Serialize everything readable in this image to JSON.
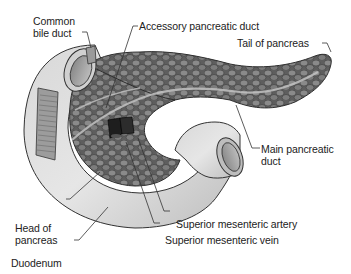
{
  "diagram": {
    "colors": {
      "pancreas_fill": "#6e6e6e",
      "pancreas_lobule": "#858585",
      "lobule_outline": "#3a3a3a",
      "duodenum_fill": "#c9c9c9",
      "duodenum_highlight": "#e4e4e4",
      "vessel": "#1e1e1e",
      "duct": "#b8b8b8",
      "leader_line": "#333333",
      "text": "#222222"
    },
    "labels": [
      {
        "id": "common-bile-duct",
        "lines": [
          "Common",
          "bile duct"
        ]
      },
      {
        "id": "accessory-pancreatic-duct",
        "lines": [
          "Accessory pancreatic duct"
        ]
      },
      {
        "id": "tail-of-pancreas",
        "lines": [
          "Tail of pancreas"
        ]
      },
      {
        "id": "main-pancreatic-duct",
        "lines": [
          "Main pancreatic",
          "duct"
        ]
      },
      {
        "id": "head-of-pancreas",
        "lines": [
          "Head of",
          "pancreas"
        ]
      },
      {
        "id": "superior-mesenteric-artery",
        "lines": [
          "Superior mesenteric artery"
        ]
      },
      {
        "id": "superior-mesenteric-vein",
        "lines": [
          "Superior mesenteric vein"
        ]
      },
      {
        "id": "duodenum",
        "lines": [
          "Duodenum"
        ]
      }
    ]
  }
}
